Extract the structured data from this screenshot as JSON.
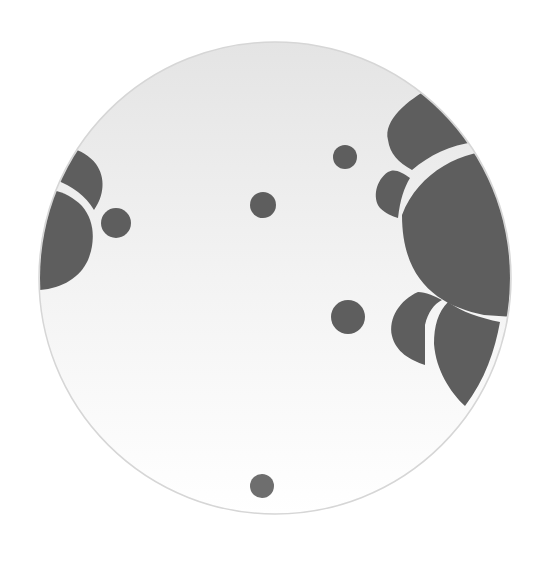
{
  "image": {
    "subject": "Round white ceramic plate with gray floral and dot pattern",
    "background_color": "#ffffff",
    "plate": {
      "cx": 275,
      "cy": 278,
      "r": 236,
      "fill_top": "#e6e6e6",
      "fill_bottom": "#ffffff",
      "rim_color": "#d8d8d8"
    },
    "pattern_color": "#5e5e5e",
    "dots": [
      {
        "cx": 345,
        "cy": 157,
        "r": 12
      },
      {
        "cx": 263,
        "cy": 205,
        "r": 13
      },
      {
        "cx": 116,
        "cy": 223,
        "r": 15
      },
      {
        "cx": 348,
        "cy": 317,
        "r": 17
      },
      {
        "cx": 262,
        "cy": 486,
        "r": 12
      }
    ]
  }
}
